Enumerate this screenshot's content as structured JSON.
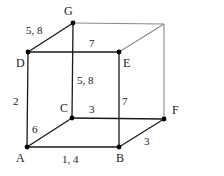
{
  "diagram": {
    "type": "cube-graph",
    "colors": {
      "front_edge": "#1a1a1a",
      "back_edge": "#8a8a8a",
      "vertex": "#000000",
      "background": "#ffffff"
    },
    "vertices": [
      {
        "id": "A",
        "label": "A",
        "x": 27,
        "y": 147,
        "lx": 16,
        "ly": 162,
        "dot": true
      },
      {
        "id": "B",
        "label": "B",
        "x": 119,
        "y": 147,
        "lx": 116,
        "ly": 162,
        "dot": true
      },
      {
        "id": "C",
        "label": "C",
        "x": 72,
        "y": 118,
        "lx": 60,
        "ly": 112,
        "dot": true
      },
      {
        "id": "D",
        "label": "D",
        "x": 28,
        "y": 52,
        "lx": 16,
        "ly": 67,
        "dot": true
      },
      {
        "id": "E",
        "label": "E",
        "x": 119,
        "y": 52,
        "lx": 123,
        "ly": 67,
        "dot": true
      },
      {
        "id": "F",
        "label": "F",
        "x": 164,
        "y": 119,
        "lx": 172,
        "ly": 114,
        "dot": true
      },
      {
        "id": "G",
        "label": "G",
        "x": 73,
        "y": 23,
        "lx": 64,
        "ly": 15,
        "dot": true
      },
      {
        "id": "H",
        "label": "",
        "x": 164,
        "y": 24,
        "lx": 0,
        "ly": 0,
        "dot": false
      }
    ],
    "edges": [
      {
        "from": "D",
        "to": "G",
        "weight": "5, 8",
        "lx": 26,
        "ly": 34,
        "style": "front"
      },
      {
        "from": "D",
        "to": "E",
        "weight": "7",
        "lx": 89,
        "ly": 47,
        "style": "front"
      },
      {
        "from": "G",
        "to": "C",
        "weight": "5, 8",
        "lx": 77,
        "ly": 84,
        "style": "front"
      },
      {
        "from": "D",
        "to": "A",
        "weight": "2",
        "lx": 13,
        "ly": 105,
        "style": "front"
      },
      {
        "from": "A",
        "to": "C",
        "weight": "6",
        "lx": 32,
        "ly": 133,
        "style": "front"
      },
      {
        "from": "C",
        "to": "F",
        "weight": "3",
        "lx": 89,
        "ly": 113,
        "style": "front"
      },
      {
        "from": "E",
        "to": "B",
        "weight": "7",
        "lx": 122,
        "ly": 105,
        "style": "front"
      },
      {
        "from": "A",
        "to": "B",
        "weight": "1, 4",
        "lx": 62,
        "ly": 163,
        "style": "front"
      },
      {
        "from": "B",
        "to": "F",
        "weight": "3",
        "lx": 144,
        "ly": 145,
        "style": "front"
      },
      {
        "from": "G",
        "to": "H",
        "weight": "",
        "lx": 0,
        "ly": 0,
        "style": "back"
      },
      {
        "from": "E",
        "to": "H",
        "weight": "",
        "lx": 0,
        "ly": 0,
        "style": "back"
      },
      {
        "from": "H",
        "to": "F",
        "weight": "",
        "lx": 0,
        "ly": 0,
        "style": "back"
      }
    ]
  }
}
